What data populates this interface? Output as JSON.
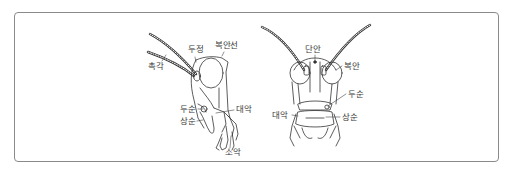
{
  "figure": {
    "title": "",
    "views": [
      {
        "name": "side-view",
        "labels": {
          "antenna": "촉각",
          "vertex": "두정",
          "compound_eye_suture": "복안선",
          "clypeus": "두순",
          "labrum": "상순",
          "mandible": "대악",
          "maxilla": "소악"
        }
      },
      {
        "name": "front-view",
        "labels": {
          "ocellus": "단안",
          "compound_eye": "복안",
          "clypeus": "두순",
          "mandible": "대악",
          "labrum": "상순"
        }
      }
    ],
    "colors": {
      "border": "#8a8a8a",
      "line": "#333333",
      "text": "#3a3a3a",
      "background": "#ffffff"
    }
  }
}
